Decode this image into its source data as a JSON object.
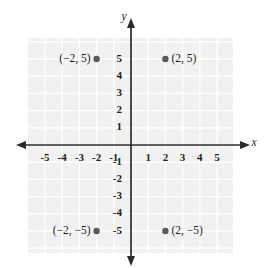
{
  "chart_data": {
    "type": "scatter",
    "title": "",
    "xlabel": "x",
    "ylabel": "y",
    "xlim": [
      -6,
      6
    ],
    "ylim": [
      -6,
      6
    ],
    "grid": true,
    "legend": null,
    "x_ticks": [
      "-5",
      "-4",
      "-3",
      "-2",
      "-1",
      "1",
      "2",
      "3",
      "4",
      "5"
    ],
    "x_tick_values": [
      -5,
      -4,
      -3,
      -2,
      -1,
      1,
      2,
      3,
      4,
      5
    ],
    "y_ticks": [
      "5",
      "4",
      "3",
      "2",
      "1",
      "-1",
      "-2",
      "-3",
      "-4",
      "-5"
    ],
    "y_tick_values": [
      5,
      4,
      3,
      2,
      1,
      -1,
      -2,
      -3,
      -4,
      -5
    ],
    "points": [
      {
        "x": -2,
        "y": 5,
        "label": "(−2, 5)",
        "label_side": "left"
      },
      {
        "x": 2,
        "y": 5,
        "label": "(2, 5)",
        "label_side": "right"
      },
      {
        "x": -2,
        "y": -5,
        "label": "(−2, −5)",
        "label_side": "left"
      },
      {
        "x": 2,
        "y": -5,
        "label": "(2, −5)",
        "label_side": "right"
      }
    ]
  },
  "colors": {
    "plot_background": "#f1f1f1",
    "grid_line": "#ffffff",
    "axis": "#2b2b2b",
    "point": "#5a5a5a",
    "text": "#1d1d1d",
    "page_background": "#ffffff"
  }
}
